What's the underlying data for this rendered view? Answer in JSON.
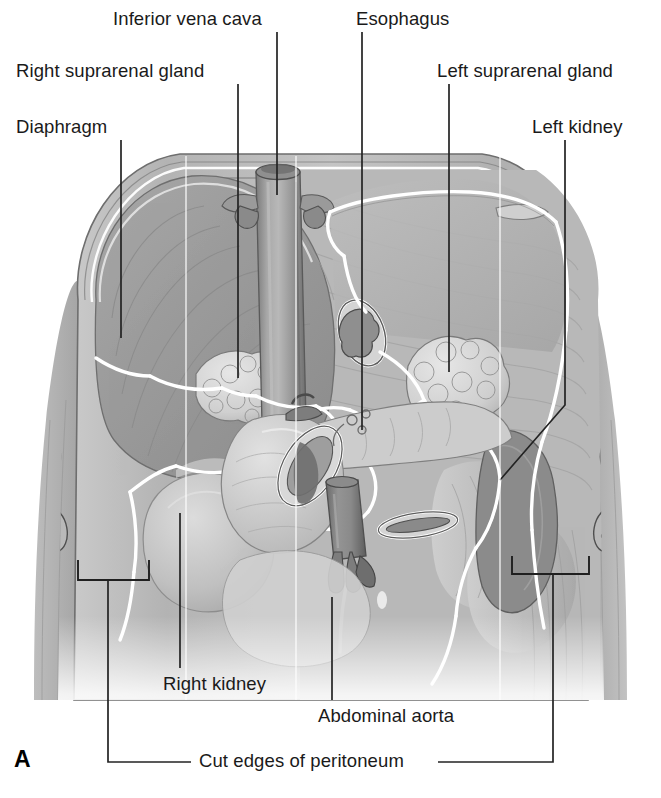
{
  "figure": {
    "panel_letter": "A",
    "type": "anatomical-illustration",
    "style": "grayscale-medical-line-art"
  },
  "labels": [
    {
      "id": "inferior-vena-cava",
      "text": "Inferior vena cava",
      "x": 113,
      "y": 10,
      "align": "left",
      "leader": [
        [
          277,
          32
        ],
        [
          277,
          195
        ]
      ]
    },
    {
      "id": "esophagus",
      "text": "Esophagus",
      "x": 356,
      "y": 10,
      "align": "left",
      "leader": [
        [
          362,
          32
        ],
        [
          362,
          430
        ]
      ]
    },
    {
      "id": "right-suprarenal",
      "text": "Right suprarenal gland",
      "x": 16,
      "y": 62,
      "align": "left",
      "leader": [
        [
          238,
          84
        ],
        [
          238,
          378
        ]
      ]
    },
    {
      "id": "left-suprarenal",
      "text": "Left suprarenal gland",
      "x": 437,
      "y": 62,
      "align": "left",
      "leader": [
        [
          449,
          84
        ],
        [
          449,
          372
        ]
      ]
    },
    {
      "id": "diaphragm",
      "text": "Diaphragm",
      "x": 16,
      "y": 118,
      "align": "left",
      "leader": [
        [
          121,
          140
        ],
        [
          121,
          338
        ]
      ]
    },
    {
      "id": "left-kidney",
      "text": "Left kidney",
      "x": 532,
      "y": 118,
      "align": "left",
      "leader": [
        [
          565,
          140
        ],
        [
          565,
          405
        ],
        [
          500,
          480
        ]
      ]
    },
    {
      "id": "right-kidney",
      "text": "Right kidney",
      "x": 163,
      "y": 675,
      "align": "left",
      "leader": [
        [
          180,
          668
        ],
        [
          180,
          513
        ]
      ]
    },
    {
      "id": "abdominal-aorta",
      "text": "Abdominal aorta",
      "x": 318,
      "y": 707,
      "align": "left",
      "leader": [
        [
          332,
          700
        ],
        [
          332,
          597
        ]
      ]
    },
    {
      "id": "cut-edges-peritoneum",
      "text": "Cut edges of peritoneum",
      "x": 199,
      "y": 752,
      "align": "left",
      "leader": []
    }
  ],
  "peritoneum_brackets": {
    "left": {
      "x1": 78,
      "x2": 149,
      "y": 580,
      "stem_x": 108,
      "stem_y2": 762
    },
    "right": {
      "x1": 512,
      "x2": 589,
      "y": 574,
      "stem_x": 553,
      "stem_y2": 762
    },
    "rule_left": {
      "x1": 108,
      "x2": 191,
      "y": 762
    },
    "rule_right": {
      "x1": 438,
      "x2": 553,
      "y": 762
    }
  },
  "structures": [
    {
      "name": "diaphragm",
      "kind": "muscle-dome"
    },
    {
      "name": "inferior-vena-cava",
      "kind": "vessel-large"
    },
    {
      "name": "esophagus",
      "kind": "tube-cut"
    },
    {
      "name": "abdominal-aorta",
      "kind": "vessel-large"
    },
    {
      "name": "right-suprarenal-gland",
      "kind": "gland-lobulated"
    },
    {
      "name": "left-suprarenal-gland",
      "kind": "gland-lobulated"
    },
    {
      "name": "right-kidney",
      "kind": "organ-bean"
    },
    {
      "name": "left-kidney",
      "kind": "organ-bean"
    },
    {
      "name": "duodenum",
      "kind": "bowel-loop"
    },
    {
      "name": "pancreas",
      "kind": "organ-elongated"
    },
    {
      "name": "colon-cut",
      "kind": "bowel-cut"
    },
    {
      "name": "psoas-muscle",
      "kind": "muscle-band"
    },
    {
      "name": "ribs",
      "kind": "bone"
    },
    {
      "name": "vertebral-column",
      "kind": "bone"
    },
    {
      "name": "peritoneum-cut-edge",
      "kind": "membrane-outline"
    }
  ],
  "palette": {
    "ink": "#1a1a1a",
    "leader": "#232323",
    "peritoneum_edge": "#ffffff",
    "tissue_light": "#d8d8d8",
    "tissue_mid": "#b4b4b4",
    "tissue_dark": "#8e8e8e",
    "tissue_deep": "#6f6f6f",
    "vessel": "#9a9a9a",
    "vessel_shadow": "#5e5e5e",
    "outline": "#4a4a4a",
    "background": "#ffffff"
  }
}
